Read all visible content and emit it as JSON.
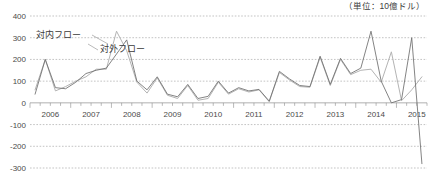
{
  "unit_note": "（単位：10億ドル）",
  "chart_data": {
    "type": "line",
    "title": "",
    "subtitle": "",
    "xlabel": "",
    "ylabel": "",
    "unit": "10億ドル",
    "grid": true,
    "legend_position": "inline-annotation",
    "ylim": [
      -300,
      400
    ],
    "yticks": [
      400,
      300,
      200,
      100,
      0,
      -100,
      -200,
      -300
    ],
    "ytick_labels": [
      "400",
      "300",
      "200",
      "100",
      "0",
      "-100",
      "-200",
      "-300"
    ],
    "xtick_labels": [
      "2006",
      "2007",
      "2008",
      "2009",
      "2010",
      "2011",
      "2012",
      "2013",
      "2014",
      "2015"
    ],
    "x_period": "quarterly",
    "x": [
      "2006Q1",
      "2006Q2",
      "2006Q3",
      "2006Q4",
      "2007Q1",
      "2007Q2",
      "2007Q3",
      "2007Q4",
      "2008Q1",
      "2008Q2",
      "2008Q3",
      "2008Q4",
      "2009Q1",
      "2009Q2",
      "2009Q3",
      "2009Q4",
      "2010Q1",
      "2010Q2",
      "2010Q3",
      "2010Q4",
      "2011Q1",
      "2011Q2",
      "2011Q3",
      "2011Q4",
      "2012Q1",
      "2012Q2",
      "2012Q3",
      "2012Q4",
      "2013Q1",
      "2013Q2",
      "2013Q3",
      "2013Q4",
      "2014Q1",
      "2014Q2",
      "2014Q3",
      "2014Q4",
      "2015Q1",
      "2015Q2",
      "2015Q3"
    ],
    "series": [
      {
        "name": "対内フロー",
        "color": "#b4b4b4",
        "values": [
          60,
          200,
          55,
          75,
          100,
          120,
          155,
          155,
          330,
          240,
          95,
          45,
          115,
          35,
          20,
          80,
          12,
          20,
          95,
          40,
          65,
          50,
          60,
          5,
          140,
          105,
          75,
          72,
          210,
          80,
          200,
          130,
          150,
          155,
          95,
          235,
          10,
          60,
          120
        ]
      },
      {
        "name": "対外フロー",
        "color": "#6e6e6e",
        "values": [
          40,
          200,
          70,
          65,
          95,
          135,
          150,
          160,
          225,
          290,
          100,
          60,
          120,
          40,
          28,
          85,
          20,
          30,
          100,
          45,
          70,
          55,
          62,
          8,
          145,
          110,
          80,
          75,
          215,
          85,
          205,
          135,
          160,
          330,
          100,
          0,
          15,
          300,
          -280
        ]
      }
    ],
    "annotations": [
      {
        "text": "対内フロー",
        "series": "対内フロー"
      },
      {
        "text": "対外フロー",
        "series": "対外フロー"
      }
    ]
  }
}
